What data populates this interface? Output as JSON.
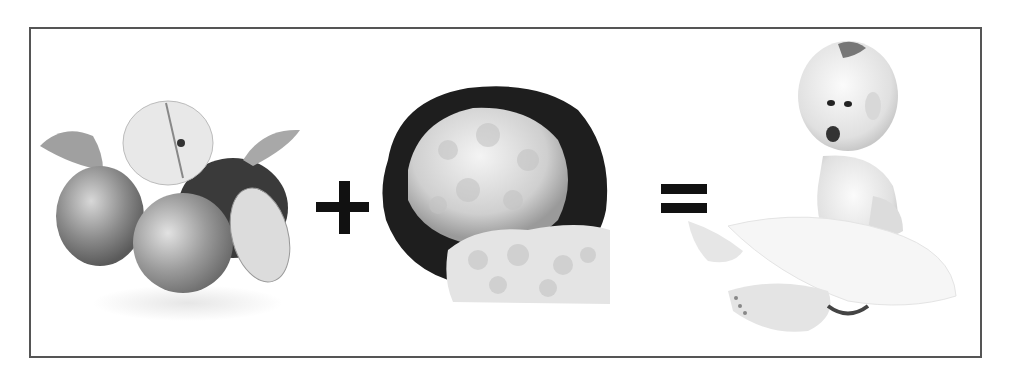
{
  "equation": {
    "terms": [
      {
        "id": "apples",
        "label": "Apples",
        "description": "group of apples with leaves, one sliced"
      },
      {
        "id": "cauliflower",
        "label": "Cauliflower",
        "description": "cauliflower head with dark leaves and florets"
      },
      {
        "id": "baby",
        "label": "Baby",
        "description": "smiling baby sitting on white blanket"
      }
    ],
    "operators": [
      "+",
      "="
    ]
  },
  "colors": {
    "frame_border": "#555555",
    "operator": "#111111",
    "background": "#ffffff"
  }
}
